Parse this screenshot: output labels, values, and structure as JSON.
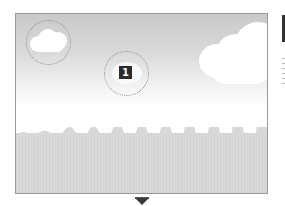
{
  "figure": {
    "focus_marker": {
      "label": "1"
    },
    "colors": {
      "sky_top": "#c9c9c9",
      "sky_bottom": "#ffffff",
      "ground": "#d8d8d8",
      "frame_border": "#9a9a9a",
      "badge_bg": "#2b2b2b",
      "arrow": "#3a3a3a"
    },
    "icons": {
      "next_step": "down-arrow-icon"
    }
  }
}
